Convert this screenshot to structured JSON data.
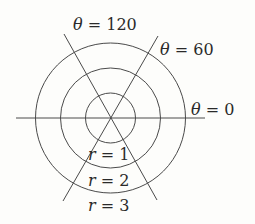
{
  "diagram": {
    "center": {
      "x": 110.5,
      "y": 118
    },
    "stroke_color": "#4a4a4a",
    "circles": [
      {
        "r_value": "1",
        "radius_px": 25
      },
      {
        "r_value": "2",
        "radius_px": 50
      },
      {
        "r_value": "3",
        "radius_px": 75
      }
    ],
    "rays": [
      {
        "theta": "0"
      },
      {
        "theta": "60"
      },
      {
        "theta": "120"
      }
    ],
    "labels": {
      "theta_120": {
        "var": "θ",
        "eq": " = ",
        "val": "120"
      },
      "theta_60": {
        "var": "θ",
        "eq": " = ",
        "val": "60"
      },
      "theta_0": {
        "var": "θ",
        "eq": " = ",
        "val": "0"
      },
      "r_1": {
        "var": "r",
        "eq": " = ",
        "val": "1"
      },
      "r_2": {
        "var": "r",
        "eq": " = ",
        "val": "2"
      },
      "r_3": {
        "var": "r",
        "eq": " = ",
        "val": "3"
      }
    }
  }
}
